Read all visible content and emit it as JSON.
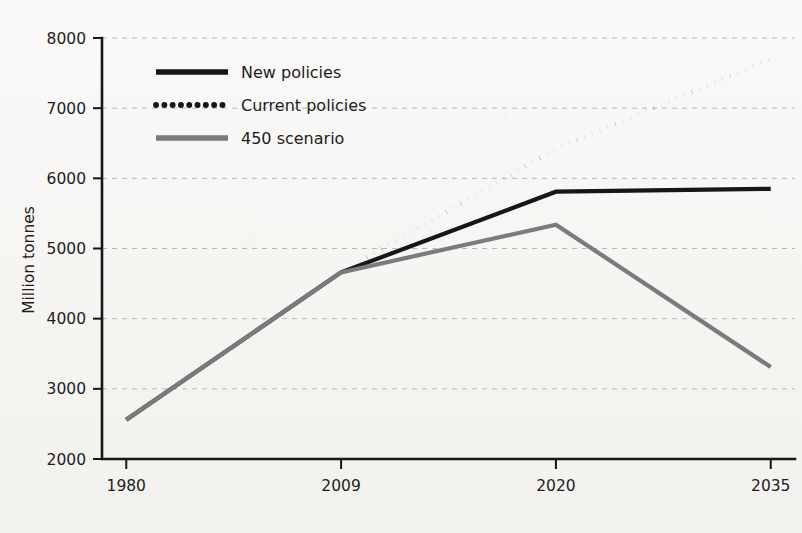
{
  "chart_data": {
    "type": "line",
    "title": "",
    "subtitle": "",
    "xlabel": "",
    "ylabel": "Million tonnes",
    "categories": [
      "1980",
      "2009",
      "2020",
      "2035"
    ],
    "x_is_categorical": true,
    "ylim": [
      2000,
      8000
    ],
    "ytick_step": 1000,
    "yticks": [
      "2000",
      "3000",
      "4000",
      "5000",
      "6000",
      "7000",
      "8000"
    ],
    "grid": "horizontal-dashed",
    "legend_position": "upper-left-inside",
    "series": [
      {
        "name": "New policies",
        "style": "solid",
        "color": "#161616",
        "width": 4.2,
        "values": [
          2560,
          4660,
          5810,
          5850
        ]
      },
      {
        "name": "Current policies",
        "style": "dotted",
        "color": "#161616",
        "width": 4.6,
        "values": [
          2560,
          4660,
          6420,
          7700
        ]
      },
      {
        "name": "450 scenario",
        "style": "solid",
        "color": "#7b7b7b",
        "width": 4.2,
        "values": [
          2560,
          4660,
          5340,
          3310
        ]
      }
    ]
  },
  "legend": {
    "items": [
      {
        "label": "New policies"
      },
      {
        "label": "Current policies"
      },
      {
        "label": "450 scenario"
      }
    ]
  },
  "axes": {
    "y_title": "Million tonnes",
    "y_labels": [
      "8000",
      "7000",
      "6000",
      "5000",
      "4000",
      "3000",
      "2000"
    ],
    "x_labels": [
      "1980",
      "2009",
      "2020",
      "2035"
    ]
  },
  "colors": {
    "background": "#f7f6f3",
    "ink": "#161616",
    "gray_series": "#7b7b7b",
    "gridline": "#b9b7b3"
  }
}
